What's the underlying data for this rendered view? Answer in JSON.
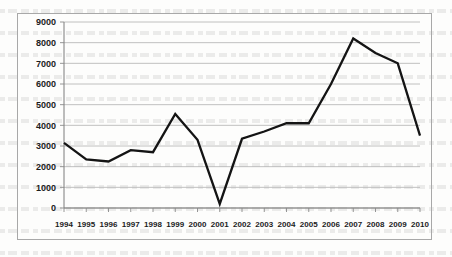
{
  "chart_data": {
    "type": "line",
    "title": "",
    "subtitle": "",
    "xlabel": "",
    "ylabel": "",
    "categories": [
      "1994",
      "1995",
      "1996",
      "1997",
      "1998",
      "1999",
      "2000",
      "2001",
      "2002",
      "2003",
      "2004",
      "2005",
      "2006",
      "2007",
      "2008",
      "2009",
      "2010"
    ],
    "values": [
      3150,
      2350,
      2250,
      2800,
      2700,
      4550,
      3300,
      200,
      3350,
      3700,
      4100,
      4100,
      6000,
      8200,
      7500,
      7000,
      3500
    ],
    "series": [
      {
        "name": "",
        "values": [
          3150,
          2350,
          2250,
          2800,
          2700,
          4550,
          3300,
          200,
          3350,
          3700,
          4100,
          4100,
          6000,
          8200,
          7500,
          7000,
          3500
        ]
      }
    ],
    "ylim": [
      0,
      9000
    ],
    "ytick_labels": [
      "0",
      "1000",
      "2000",
      "3000",
      "4000",
      "5000",
      "6000",
      "7000",
      "8000",
      "9000"
    ],
    "ytick_values": [
      0,
      1000,
      2000,
      3000,
      4000,
      5000,
      6000,
      7000,
      8000,
      9000
    ],
    "grid": true,
    "grid_axis": "y",
    "legend": false,
    "legend_position": "none",
    "line_color": "#141414",
    "grid_color": "#b9b9b9",
    "axis_color": "#7d7d7d",
    "markers": false,
    "annotations": []
  }
}
